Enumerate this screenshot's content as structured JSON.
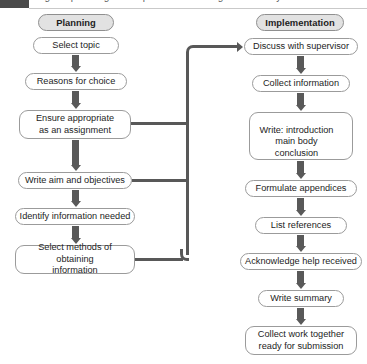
{
  "caption": {
    "text": "Figure: planning and implementation stages of a study",
    "tab_label": ""
  },
  "flowchart": {
    "columns": [
      {
        "id": "planning",
        "header": "Planning",
        "nodes": [
          "Select topic",
          "Reasons for choice",
          "Ensure appropriate\nas an assignment",
          "Write aim and objectives",
          "Identify information needed",
          "Select methods of obtaining\ninformation"
        ]
      },
      {
        "id": "implementation",
        "header": "Implementation",
        "nodes": [
          "Discuss with supervisor",
          "Collect information",
          "Write: introduction\nmain body\nconclusion",
          "Formulate appendices",
          "List references",
          "Acknowledge help received",
          "Write summary",
          "Collect work together\nready for submission"
        ]
      }
    ],
    "left_nodes": {
      "n1": "Select topic",
      "n2": "Reasons for choice",
      "n3_line1": "Ensure appropriate",
      "n3_line2": "as an assignment",
      "n4": "Write aim and objectives",
      "n5": "Identify information needed",
      "n6_line1": "Select methods of obtaining",
      "n6_line2": "information"
    },
    "right_nodes": {
      "r1": "Discuss with supervisor",
      "r2": "Collect information",
      "r3_line1": "Write: introduction",
      "r3_line2": "main body",
      "r3_line3": "conclusion",
      "r4": "Formulate appendices",
      "r5": "List references",
      "r6": "Acknowledge help received",
      "r7": "Write summary",
      "r8_line1": "Collect work together",
      "r8_line2": "ready for submission"
    },
    "headers": {
      "planning": "Planning",
      "implementation": "Implementation"
    },
    "colors": {
      "box_border": "#9b9b9b",
      "header_fill": "#e2e2e2",
      "connector": "#585858",
      "text": "#1d1d1d",
      "background": "#ffffff"
    }
  }
}
